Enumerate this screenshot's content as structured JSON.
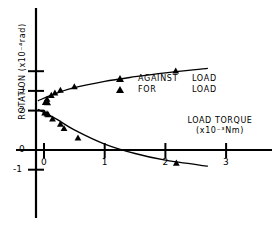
{
  "chart_data": {
    "type": "scatter",
    "title": "",
    "xlabel": "LOAD TORQUE",
    "xlabel_units": "(x10⁻³Nm)",
    "ylabel": "ROTATION",
    "ylabel_units": "(x10⁻⁴rad)",
    "ylabel_full": "ROTATION  (x10⁻⁴rad)",
    "xlim": [
      -0.25,
      3.45
    ],
    "ylim": [
      -1.6,
      4.9
    ],
    "xticks": [
      0,
      1,
      2,
      3
    ],
    "xtick_labels": [
      "0",
      "1",
      "2",
      "3"
    ],
    "yticks": [
      -1,
      0,
      2,
      3,
      4
    ],
    "ytick_labels": [
      "-1",
      "0",
      "2",
      "3",
      ""
    ],
    "grid": false,
    "legend_position": "center-right",
    "series": [
      {
        "name": "AGAINST LOAD",
        "marker": "triangle",
        "color": "#000000",
        "points": [
          {
            "x": 0.02,
            "y": 2.42
          },
          {
            "x": 0.06,
            "y": 2.4
          },
          {
            "x": 0.05,
            "y": 2.58
          },
          {
            "x": 0.12,
            "y": 2.78
          },
          {
            "x": 0.18,
            "y": 2.9
          },
          {
            "x": 0.27,
            "y": 3.04
          },
          {
            "x": 0.5,
            "y": 3.22
          },
          {
            "x": 2.17,
            "y": 4.02
          }
        ],
        "fit_curve": [
          {
            "x": -0.1,
            "y": 2.5
          },
          {
            "x": 0.2,
            "y": 2.88
          },
          {
            "x": 0.5,
            "y": 3.16
          },
          {
            "x": 1.0,
            "y": 3.48
          },
          {
            "x": 1.5,
            "y": 3.72
          },
          {
            "x": 2.0,
            "y": 3.92
          },
          {
            "x": 2.7,
            "y": 4.14
          }
        ]
      },
      {
        "name": "FOR LOAD",
        "marker": "triangle",
        "color": "#000000",
        "points": [
          {
            "x": 0.01,
            "y": 1.88
          },
          {
            "x": 0.05,
            "y": 1.84
          },
          {
            "x": 0.07,
            "y": 1.8
          },
          {
            "x": 0.14,
            "y": 1.58
          },
          {
            "x": 0.27,
            "y": 1.32
          },
          {
            "x": 0.33,
            "y": 1.1
          },
          {
            "x": 0.56,
            "y": 0.62
          },
          {
            "x": 2.18,
            "y": -0.66
          }
        ],
        "fit_curve": [
          {
            "x": -0.1,
            "y": 2.06
          },
          {
            "x": 0.2,
            "y": 1.58
          },
          {
            "x": 0.5,
            "y": 1.02
          },
          {
            "x": 1.0,
            "y": 0.3
          },
          {
            "x": 1.5,
            "y": -0.18
          },
          {
            "x": 2.0,
            "y": -0.52
          },
          {
            "x": 2.7,
            "y": -0.82
          }
        ]
      }
    ],
    "legend": [
      {
        "label_name": "AGAINST",
        "label_tail": "LOAD",
        "marker": "triangle"
      },
      {
        "label_name": "FOR",
        "label_tail": "LOAD",
        "marker": "triangle"
      }
    ]
  }
}
